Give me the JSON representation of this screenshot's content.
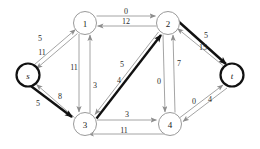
{
  "figure": {
    "background": "#ffffff",
    "edge_color": "#8d8d8d",
    "highlight_color": "#111111",
    "node_fill": "#ffffff",
    "node_stroke": "#9a9a9a",
    "node_highlight_stroke": "#111111"
  },
  "nodes": [
    {
      "id": "s",
      "label": "s",
      "italic": true,
      "cx": 28,
      "cy": 75,
      "r": 11.5,
      "highlighted": true
    },
    {
      "id": "1",
      "label": "1",
      "italic": false,
      "cx": 85,
      "cy": 23,
      "r": 11.5,
      "highlighted": false
    },
    {
      "id": "2",
      "label": "2",
      "italic": false,
      "cx": 168,
      "cy": 23,
      "r": 11.5,
      "highlighted": false
    },
    {
      "id": "3",
      "label": "3",
      "italic": false,
      "cx": 85,
      "cy": 124,
      "r": 11.5,
      "highlighted": false
    },
    {
      "id": "4",
      "label": "4",
      "italic": false,
      "cx": 170,
      "cy": 124,
      "r": 11.5,
      "highlighted": false
    },
    {
      "id": "t",
      "label": "t",
      "italic": true,
      "cx": 232,
      "cy": 75,
      "r": 11.5,
      "highlighted": true
    }
  ],
  "edges": [
    {
      "from": "s",
      "to": "1",
      "label": "5",
      "highlighted": false
    },
    {
      "from": "1",
      "to": "s",
      "label": "11",
      "highlighted": false
    },
    {
      "from": "1",
      "to": "2",
      "label": "0",
      "highlighted": false
    },
    {
      "from": "2",
      "to": "1",
      "label": "12",
      "highlighted": false
    },
    {
      "from": "1",
      "to": "3",
      "label": "11",
      "highlighted": false
    },
    {
      "from": "3",
      "to": "1",
      "label": "3",
      "highlighted": false
    },
    {
      "from": "s",
      "to": "3",
      "label": "5",
      "highlighted": true
    },
    {
      "from": "3",
      "to": "s",
      "label": "8",
      "highlighted": false
    },
    {
      "from": "2",
      "to": "3",
      "label": "5",
      "highlighted": false
    },
    {
      "from": "3",
      "to": "2",
      "label": "4",
      "highlighted": true
    },
    {
      "from": "2",
      "to": "4",
      "label": "0",
      "highlighted": false
    },
    {
      "from": "4",
      "to": "2",
      "label": "7",
      "highlighted": false
    },
    {
      "from": "3",
      "to": "4",
      "label": "3",
      "highlighted": false
    },
    {
      "from": "4",
      "to": "3",
      "label": "11",
      "highlighted": false
    },
    {
      "from": "2",
      "to": "t",
      "label": "5",
      "highlighted": true
    },
    {
      "from": "t",
      "to": "2",
      "label": "15",
      "highlighted": false
    },
    {
      "from": "4",
      "to": "t",
      "label": "0",
      "highlighted": false
    },
    {
      "from": "t",
      "to": "4",
      "label": "4",
      "highlighted": false
    }
  ],
  "augmenting_path": [
    "s",
    "3",
    "2",
    "t"
  ],
  "edge_labels": {
    "s1": "5",
    "1s": "11",
    "12": "0",
    "21": "12",
    "13": "11",
    "31": "3",
    "s3": "5",
    "3s": "8",
    "23": "5",
    "32": "4",
    "24": "0",
    "42": "7",
    "34": "3",
    "43": "11",
    "2t": "5",
    "t2": "15",
    "4t": "0",
    "t4": "4"
  },
  "node_labels": {
    "s": "s",
    "n1": "1",
    "n2": "2",
    "n3": "3",
    "n4": "4",
    "t": "t"
  }
}
